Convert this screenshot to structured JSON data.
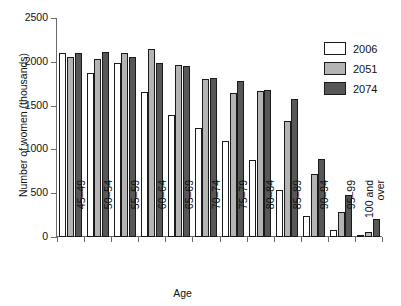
{
  "chart_data": {
    "type": "bar",
    "title": "",
    "xlabel": "Age",
    "ylabel": "Number of women (thousands)",
    "ylim": [
      0,
      2500
    ],
    "yticks": [
      0,
      500,
      1000,
      1500,
      2000,
      2500
    ],
    "grid": false,
    "legend_position": "top-right",
    "categories": [
      "45–49",
      "50–54",
      "55–59",
      "60–64",
      "65–69",
      "70–74",
      "75–79",
      "80–84",
      "85–89",
      "90–94",
      "95–99",
      "100 and over"
    ],
    "series": [
      {
        "name": "2006",
        "color": "#ffffff",
        "values": [
          2100,
          1870,
          1985,
          1650,
          1395,
          1250,
          1095,
          875,
          535,
          240,
          75,
          15
        ]
      },
      {
        "name": "2051",
        "color": "#b4b4b4",
        "values": [
          2050,
          2035,
          2105,
          2150,
          1965,
          1800,
          1640,
          1665,
          1325,
          720,
          280,
          60
        ]
      },
      {
        "name": "2074",
        "color": "#575757",
        "values": [
          2100,
          2110,
          2060,
          1985,
          1950,
          1815,
          1780,
          1680,
          1580,
          890,
          475,
          210
        ]
      }
    ]
  },
  "axis": {
    "y_title": "Number of women (thousands)",
    "x_title": "Age",
    "y_tick_labels": [
      "0",
      "500",
      "1000",
      "1500",
      "2000",
      "2500"
    ]
  },
  "legend": {
    "items": [
      {
        "label": "2006",
        "swatch": "s2006"
      },
      {
        "label": "2051",
        "swatch": "s2051"
      },
      {
        "label": "2074",
        "swatch": "s2074"
      }
    ]
  }
}
